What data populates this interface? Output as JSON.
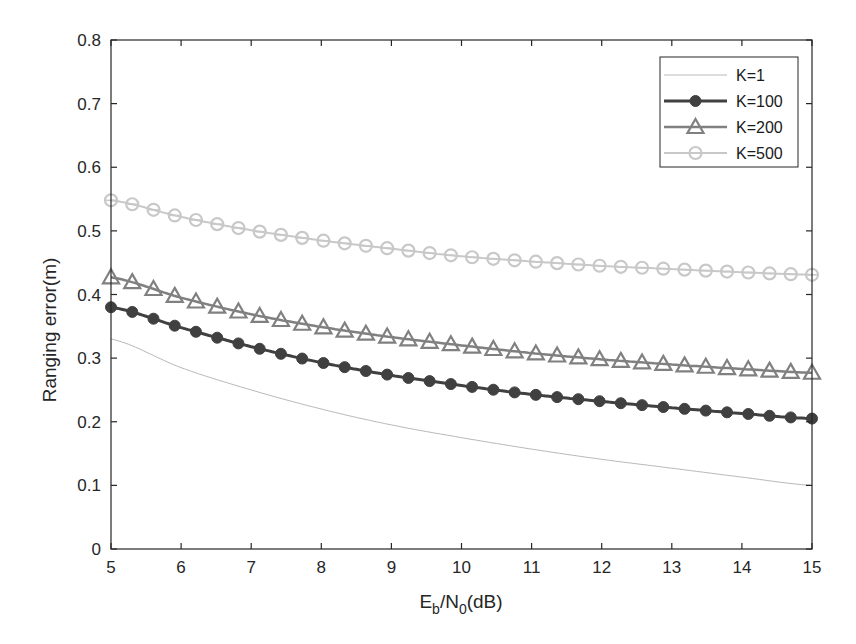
{
  "chart_data": {
    "type": "line",
    "title": "",
    "xlabel": "E_b/N_0(dB)",
    "xlabel_parts": {
      "main1": "E",
      "sub1": "b",
      "main2": "/N",
      "sub2": "0",
      "tail": "(dB)"
    },
    "ylabel": "Ranging error(m)",
    "xlim": [
      5,
      15
    ],
    "ylim": [
      0,
      0.8
    ],
    "xticks": [
      5,
      6,
      7,
      8,
      9,
      10,
      11,
      12,
      13,
      14,
      15
    ],
    "xtick_labels": [
      "5",
      "6",
      "7",
      "8",
      "9",
      "10",
      "11",
      "12",
      "13",
      "14",
      "15"
    ],
    "yticks": [
      0,
      0.1,
      0.2,
      0.3,
      0.4,
      0.5,
      0.6,
      0.7,
      0.8
    ],
    "ytick_labels": [
      "0",
      "0.1",
      "0.2",
      "0.3",
      "0.4",
      "0.5",
      "0.6",
      "0.7",
      "0.8"
    ],
    "grid": false,
    "legend_position": "upper right",
    "x": [
      5,
      6,
      7,
      8,
      9,
      10,
      11,
      12,
      13,
      14,
      15
    ],
    "marker_step": 0.3,
    "series": [
      {
        "name": "K=1",
        "values": [
          0.33,
          0.285,
          0.25,
          0.22,
          0.195,
          0.175,
          0.157,
          0.141,
          0.127,
          0.113,
          0.1
        ],
        "color": "#b8b8b8",
        "line_width": 1,
        "marker": "none"
      },
      {
        "name": "K=100",
        "values": [
          0.38,
          0.348,
          0.318,
          0.293,
          0.273,
          0.257,
          0.243,
          0.232,
          0.222,
          0.213,
          0.205
        ],
        "color": "#404040",
        "line_width": 3,
        "marker": "asterisk"
      },
      {
        "name": "K=200",
        "values": [
          0.427,
          0.395,
          0.369,
          0.349,
          0.333,
          0.32,
          0.308,
          0.298,
          0.29,
          0.283,
          0.277
        ],
        "color": "#808080",
        "line_width": 2.5,
        "marker": "triangle"
      },
      {
        "name": "K=500",
        "values": [
          0.548,
          0.522,
          0.501,
          0.485,
          0.472,
          0.46,
          0.452,
          0.445,
          0.44,
          0.435,
          0.431
        ],
        "color": "#c8c8c8",
        "line_width": 2,
        "marker": "circle"
      }
    ]
  }
}
